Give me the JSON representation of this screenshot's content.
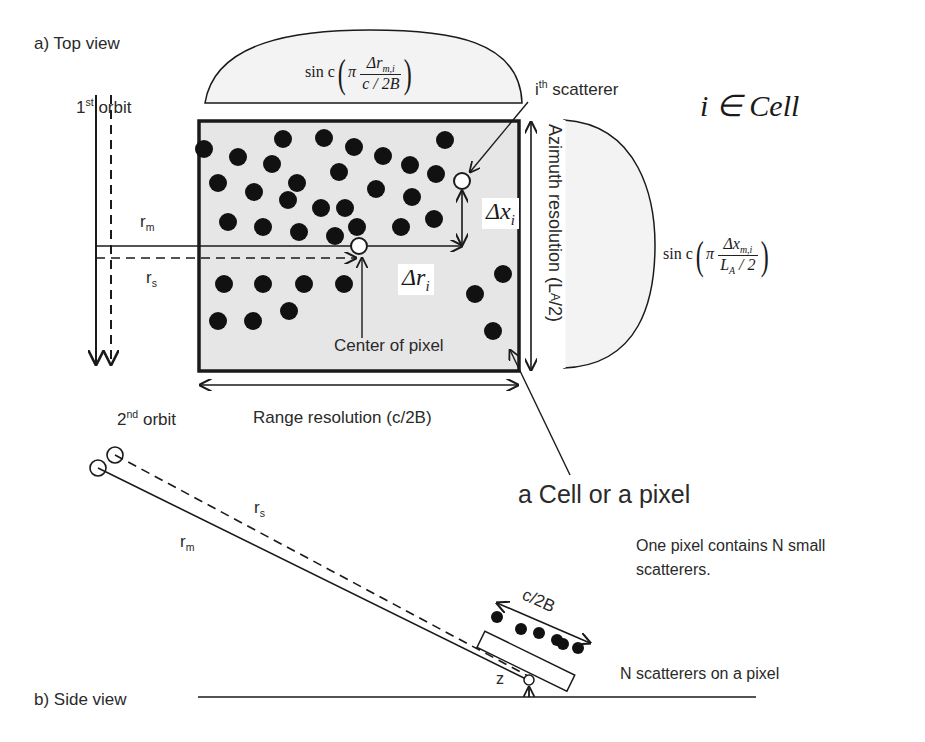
{
  "figure": {
    "panel_a_label": "a) Top view",
    "panel_b_label": "b) Side view",
    "orbit1": {
      "num": "1",
      "sup": "st",
      "text": "orbit"
    },
    "orbit2": {
      "num": "2",
      "sup": "nd",
      "text": "orbit"
    },
    "scatterer_label": {
      "prefix": "i",
      "sup": "th",
      "text": "scatterer"
    },
    "set_notation": "i ∈ Cell",
    "r_m": {
      "base": "r",
      "sub": "m"
    },
    "r_s": {
      "base": "r",
      "sub": "s"
    },
    "delta_x": {
      "base": "Δx",
      "sub": "i"
    },
    "delta_r": {
      "base": "Δr",
      "sub": "i"
    },
    "center_label": "Center of pixel",
    "range_resolution": "Range resolution (c/2B)",
    "azimuth_resolution": {
      "text": "Azimuth resolution (L",
      "sub": "A",
      "end": "/2)"
    },
    "range_sinc": {
      "fn": "sin c",
      "pi": "π",
      "num": "Δr",
      "num_sub": "m,i",
      "den": "c / 2B"
    },
    "azimuth_sinc": {
      "fn": "sin c",
      "pi": "π",
      "num": "Δx",
      "num_sub": "m,i",
      "den": "L",
      "den_sub": "A",
      "den_end": " / 2"
    },
    "cell_label": "a Cell or a pixel",
    "note_line1": "One pixel contains N small",
    "note_line2": "scatterers.",
    "side_c2b": "c/2B",
    "side_z": "z",
    "side_note": "N scatterers on a pixel",
    "colors": {
      "cell_fill": "#e6e6e6",
      "lobe_fill": "#f3f3f3",
      "ink": "#1a1a1a"
    }
  }
}
